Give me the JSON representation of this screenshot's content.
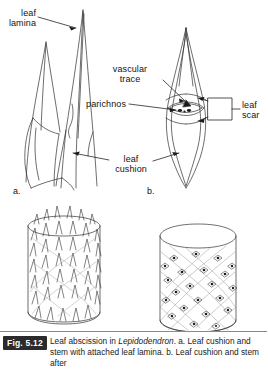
{
  "figure": {
    "subject": "Leaf abscission in Lepidodendron",
    "panels": [
      {
        "id": "a",
        "letter": "a.",
        "description": "Leaf cushion and stem with attached leaf lamina"
      },
      {
        "id": "b",
        "letter": "b.",
        "description": "Leaf cushion and stem after leaf abscission"
      }
    ],
    "labels": {
      "leaf_lamina": "leaf\nlamina",
      "vascular_trace": "vascular\ntrace",
      "parichnos": "parichnos",
      "leaf_scar": "leaf\nscar",
      "leaf_cushion": "leaf\ncushion"
    }
  },
  "caption": {
    "figure_number": "Fig. 5.12",
    "line1_pre": "Leaf abscission in ",
    "taxon": "Lepidodendron",
    "line1_post": ". a. Leaf cushion and",
    "line2": "stem with attached leaf lamina. b. Leaf cushion and stem after"
  },
  "colors": {
    "ink": "#1a1a1a",
    "line": "#3a3a3a",
    "label_box_bg": "#2b2b2b",
    "label_box_fg": "#ffffff",
    "rule": "#8a8a8a",
    "background": "#ffffff"
  }
}
